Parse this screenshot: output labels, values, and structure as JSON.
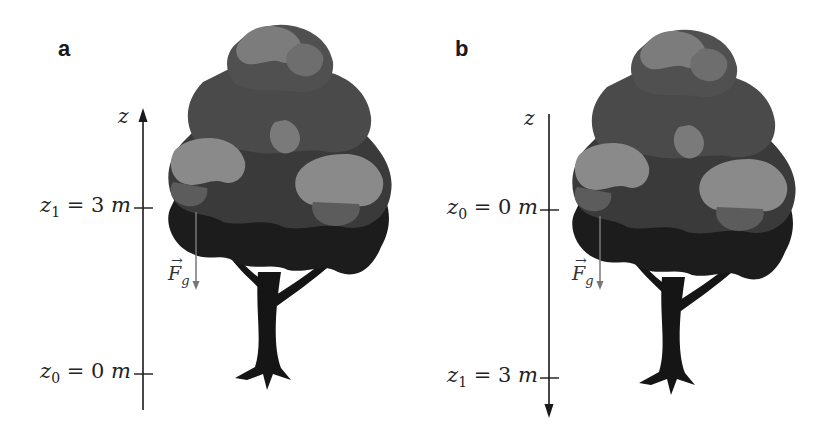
{
  "panels": [
    {
      "id": "a",
      "label": "a",
      "axis": {
        "name": "z",
        "direction": "up",
        "ticks": [
          {
            "var": "z",
            "sub": "1",
            "eq": "= 3",
            "unit": "m",
            "text": "z1 = 3 m"
          },
          {
            "var": "z",
            "sub": "0",
            "eq": "= 0",
            "unit": "m",
            "text": "z0 = 0 m"
          }
        ]
      },
      "force": {
        "symbol": "F",
        "sub": "g",
        "vec": "→",
        "direction": "down"
      },
      "object": "tree"
    },
    {
      "id": "b",
      "label": "b",
      "axis": {
        "name": "z",
        "direction": "down",
        "ticks": [
          {
            "var": "z",
            "sub": "0",
            "eq": "= 0",
            "unit": "m",
            "text": "z0 = 0 m"
          },
          {
            "var": "z",
            "sub": "1",
            "eq": "= 3",
            "unit": "m",
            "text": "z1 = 3 m"
          }
        ]
      },
      "force": {
        "symbol": "F",
        "sub": "g",
        "vec": "→",
        "direction": "down"
      },
      "object": "tree"
    }
  ],
  "colors": {
    "axis": "#1a1a1a",
    "force": "#777777",
    "foliage_light": "#8a8a8a",
    "foliage_mid": "#5c5c5c",
    "foliage_dark": "#3a3a3a",
    "foliage_darkest": "#1c1c1c",
    "trunk": "#151515"
  }
}
